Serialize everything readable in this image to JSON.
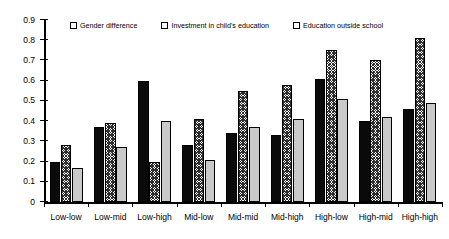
{
  "chart_data": {
    "type": "bar",
    "title": "",
    "xlabel": "",
    "ylabel": "",
    "ylim": [
      0,
      0.9
    ],
    "ytick_step": 0.1,
    "grid": false,
    "legend_position": "top",
    "categories": [
      "Low-low",
      "Low-mid",
      "Low-high",
      "Mid-low",
      "Mid-mid",
      "Mid-high",
      "High-low",
      "High-mid",
      "High-high"
    ],
    "ytick_labels": [
      "0",
      "0.1",
      "0.2",
      "0.3",
      "0.4",
      "0.5",
      "0.6",
      "0.7",
      "0.8",
      "0.9"
    ],
    "series": [
      {
        "name": "Gender difference",
        "fill": "solid-black",
        "color": "#0a0a0a",
        "values": [
          0.2,
          0.37,
          0.6,
          0.28,
          0.34,
          0.33,
          0.61,
          0.4,
          0.46
        ]
      },
      {
        "name": "Investment in child's education",
        "fill": "crosshatch",
        "color": "#2e2e2e",
        "values": [
          0.28,
          0.39,
          0.2,
          0.41,
          0.55,
          0.58,
          0.75,
          0.7,
          0.81
        ]
      },
      {
        "name": "Education outside school",
        "fill": "light-gray",
        "color": "#c9c9c9",
        "values": [
          0.17,
          0.27,
          0.4,
          0.21,
          0.37,
          0.41,
          0.51,
          0.42,
          0.49
        ]
      }
    ]
  }
}
